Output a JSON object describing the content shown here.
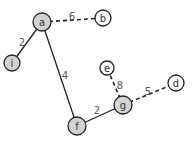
{
  "graph": {
    "colors": {
      "edge": "#222222",
      "node_stroke": "#222222",
      "node_fill_visited": "#d3d3d3",
      "node_fill_unvisited": "#ffffff",
      "text": "#333333",
      "weight_text": "#555555"
    },
    "nodes": [
      {
        "id": "a",
        "label": "a",
        "x": 42,
        "y": 22,
        "r": 9,
        "filled": true
      },
      {
        "id": "b",
        "label": "b",
        "x": 103,
        "y": 18,
        "r": 8,
        "filled": false
      },
      {
        "id": "i",
        "label": "i",
        "x": 12,
        "y": 63,
        "r": 8,
        "filled": true
      },
      {
        "id": "f",
        "label": "f",
        "x": 77,
        "y": 126,
        "r": 9,
        "filled": true
      },
      {
        "id": "g",
        "label": "g",
        "x": 123,
        "y": 105,
        "r": 9,
        "filled": true
      },
      {
        "id": "e",
        "label": "e",
        "x": 107,
        "y": 68,
        "r": 7,
        "filled": false
      },
      {
        "id": "d",
        "label": "d",
        "x": 176,
        "y": 83,
        "r": 8,
        "filled": false
      }
    ],
    "edges": [
      {
        "from": "a",
        "to": "b",
        "weight": "6",
        "style": "dashed",
        "lx": 72,
        "ly": 16
      },
      {
        "from": "a",
        "to": "i",
        "weight": "2",
        "style": "solid",
        "lx": 22,
        "ly": 42
      },
      {
        "from": "a",
        "to": "f",
        "weight": "4",
        "style": "solid",
        "lx": 65,
        "ly": 75
      },
      {
        "from": "f",
        "to": "g",
        "weight": "2",
        "style": "solid",
        "lx": 97,
        "ly": 110
      },
      {
        "from": "g",
        "to": "e",
        "weight": "8",
        "style": "dashed",
        "lx": 120,
        "ly": 85
      },
      {
        "from": "g",
        "to": "d",
        "weight": "5",
        "style": "dashed",
        "lx": 148,
        "ly": 91
      }
    ]
  }
}
